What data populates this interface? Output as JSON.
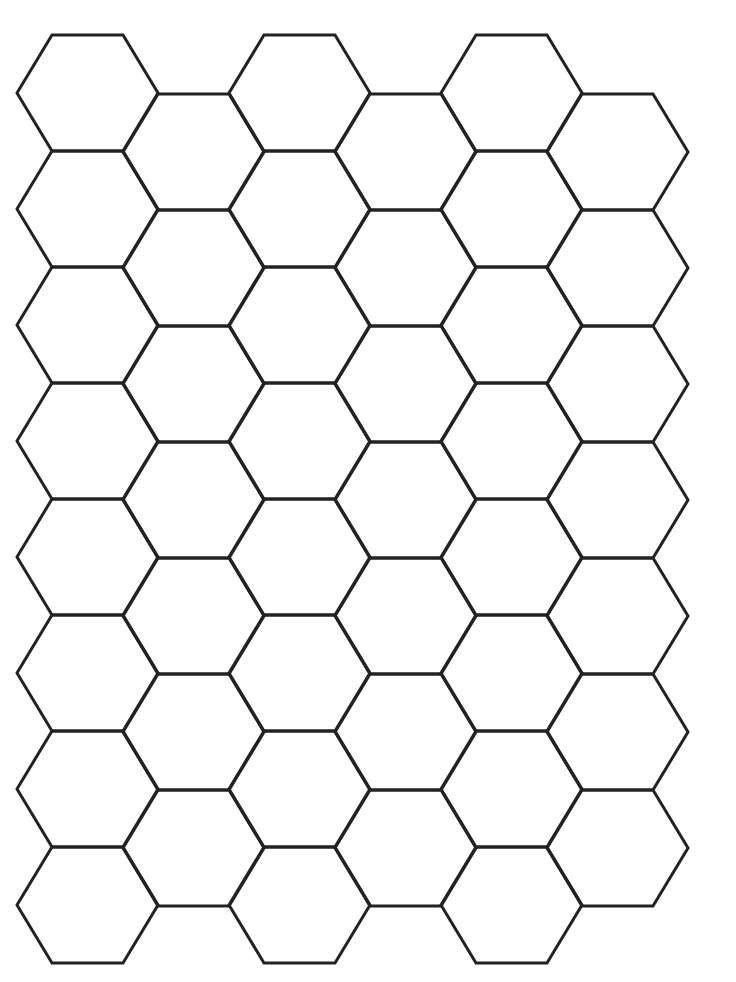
{
  "grid": {
    "stroke_color": "#222222",
    "background_color": "#ffffff",
    "stroke_width": 3,
    "hex_width": 141,
    "hex_height": 116,
    "edge_inset": 35,
    "column_spacing": 106,
    "row_spacing": 116,
    "columns": [
      {
        "x": 17,
        "top": 35,
        "count": 8
      },
      {
        "x": 123,
        "top": 94,
        "count": 7
      },
      {
        "x": 229,
        "top": 35,
        "count": 8
      },
      {
        "x": 335,
        "top": 94,
        "count": 7
      },
      {
        "x": 441,
        "top": 35,
        "count": 8
      },
      {
        "x": 547,
        "top": 94,
        "count": 7
      }
    ]
  }
}
